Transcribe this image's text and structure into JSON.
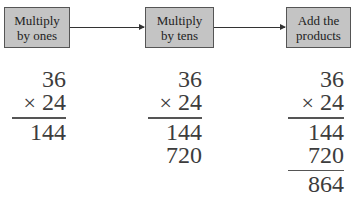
{
  "steps": [
    {
      "line1": "Multiply",
      "line2": "by ones"
    },
    {
      "line1": "Multiply",
      "line2": "by tens"
    },
    {
      "line1": "Add the",
      "line2": "products"
    }
  ],
  "calculations": [
    {
      "multiplicand": "36",
      "operator": "×",
      "multiplier": "24",
      "partial1": "144"
    },
    {
      "multiplicand": "36",
      "operator": "×",
      "multiplier": "24",
      "partial1": "144",
      "partial2": "720"
    },
    {
      "multiplicand": "36",
      "operator": "×",
      "multiplier": "24",
      "partial1": "144",
      "partial2": "720",
      "sum": "864"
    }
  ],
  "colors": {
    "box_fill": "#c4c4c4",
    "box_border": "#555555",
    "text": "#3c3c3c"
  }
}
